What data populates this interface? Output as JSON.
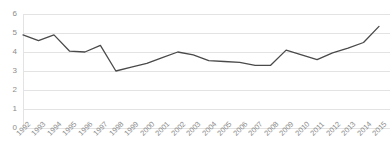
{
  "chart_data": {
    "type": "line",
    "title": "",
    "subtitle": "",
    "xlabel": "",
    "ylabel": "",
    "categories": [
      "1992",
      "1993",
      "1994",
      "1995",
      "1996",
      "1997",
      "1998",
      "1999",
      "2000",
      "2001",
      "2002",
      "2003",
      "2004",
      "2005",
      "2006",
      "2007",
      "2008",
      "2009",
      "2010",
      "2011",
      "2012",
      "2013",
      "2014",
      "2015"
    ],
    "values": [
      4.9,
      4.6,
      4.9,
      4.05,
      4.0,
      4.35,
      3.0,
      3.2,
      3.4,
      3.7,
      4.0,
      3.85,
      3.55,
      3.5,
      3.45,
      3.3,
      3.3,
      4.1,
      3.85,
      3.6,
      3.95,
      4.2,
      4.5,
      5.35
    ],
    "series": [
      {
        "name": "series-1",
        "values": [
          4.9,
          4.6,
          4.9,
          4.05,
          4.0,
          4.35,
          3.0,
          3.2,
          3.4,
          3.7,
          4.0,
          3.85,
          3.55,
          3.5,
          3.45,
          3.3,
          3.3,
          4.1,
          3.85,
          3.6,
          3.95,
          4.2,
          4.5,
          5.35
        ],
        "color": "#4a4a4a"
      }
    ],
    "ylim": [
      0,
      6
    ],
    "yticks": [
      0,
      1,
      2,
      3,
      4,
      5,
      6
    ],
    "ytick_labels": [
      "0",
      "1",
      "2",
      "3",
      "4",
      "5",
      "6"
    ],
    "xtick_labels": [
      "1992",
      "1993",
      "1994",
      "1995",
      "1996",
      "1997",
      "1998",
      "1999",
      "2000",
      "2001",
      "2002",
      "2003",
      "2004",
      "2005",
      "2006",
      "2007",
      "2008",
      "2009",
      "2010",
      "2011",
      "2012",
      "2013",
      "2014",
      "2015"
    ],
    "grid": true,
    "grid_axis": "y",
    "legend": false,
    "legend_position": "none",
    "colors": {
      "line": "#4a4a4a",
      "grid": "#e3e3e3",
      "tick_text": "#8c8c8c",
      "background": "#ffffff"
    }
  }
}
